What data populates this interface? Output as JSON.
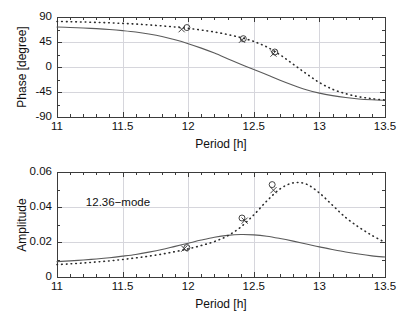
{
  "figure": {
    "background": "#ffffff",
    "axis_color": "#3b3b3b",
    "grid_color": "#d6d6dc",
    "solid_curve_color": "#5a5a5a",
    "dotted_curve_color": "#2b2b2b",
    "marker_color": "#303030"
  },
  "chart_data": [
    {
      "type": "line",
      "id": "phase-panel",
      "title": "",
      "xlabel": "Period [h]",
      "ylabel": "Phase [degree]",
      "xlim": [
        11,
        13.5
      ],
      "ylim": [
        -90,
        90
      ],
      "xticks": [
        11,
        11.5,
        12,
        12.5,
        13,
        13.5
      ],
      "xticklabels": [
        "11",
        "11.5",
        "12",
        "12.5",
        "13",
        "13.5"
      ],
      "yticks": [
        -90,
        -45,
        0,
        45,
        90
      ],
      "yticklabels": [
        "-90",
        "-45",
        "0",
        "45",
        "90"
      ],
      "x_minor_tick_step": 0.1,
      "grid": true,
      "legend": null,
      "series": [
        {
          "name": "model-solid",
          "style": "solid",
          "x": [
            11.0,
            11.1,
            11.2,
            11.3,
            11.4,
            11.5,
            11.6,
            11.7,
            11.8,
            11.9,
            12.0,
            12.1,
            12.2,
            12.3,
            12.4,
            12.5,
            12.6,
            12.7,
            12.8,
            12.9,
            13.0,
            13.1,
            13.2,
            13.3,
            13.4,
            13.5
          ],
          "values": [
            72.0,
            71.2,
            70.2,
            69.0,
            67.5,
            65.5,
            63.0,
            59.5,
            55.0,
            49.0,
            42.0,
            34.0,
            25.0,
            15.0,
            5.0,
            -4.5,
            -14.0,
            -24.0,
            -33.0,
            -41.0,
            -47.0,
            -51.5,
            -55.0,
            -57.5,
            -59.0,
            -60.0
          ]
        },
        {
          "name": "observed-fit-dotted",
          "style": "dotted",
          "x": [
            11.0,
            11.1,
            11.2,
            11.3,
            11.4,
            11.5,
            11.6,
            11.7,
            11.8,
            11.9,
            12.0,
            12.1,
            12.2,
            12.3,
            12.4,
            12.5,
            12.6,
            12.7,
            12.8,
            12.9,
            13.0,
            13.1,
            13.2,
            13.3,
            13.4,
            13.5
          ],
          "values": [
            82.0,
            81.5,
            81.0,
            80.3,
            79.5,
            78.5,
            77.3,
            75.8,
            74.0,
            72.0,
            69.5,
            66.5,
            63.0,
            58.5,
            53.0,
            46.0,
            36.0,
            22.0,
            5.0,
            -12.0,
            -28.0,
            -40.0,
            -48.0,
            -53.5,
            -57.0,
            -59.5
          ]
        }
      ],
      "markers": [
        {
          "shape": "circle",
          "x": 11.99,
          "y": 71.0
        },
        {
          "shape": "cross",
          "x": 11.95,
          "y": 68.0
        },
        {
          "shape": "circle",
          "x": 12.42,
          "y": 51.0
        },
        {
          "shape": "cross",
          "x": 12.41,
          "y": 49.0
        },
        {
          "shape": "circle",
          "x": 12.66,
          "y": 27.0
        },
        {
          "shape": "cross",
          "x": 12.65,
          "y": 24.0
        }
      ]
    },
    {
      "type": "line",
      "id": "amplitude-panel",
      "title": "",
      "xlabel": "Period [h]",
      "ylabel": "Amplitude",
      "annotation": "12.36−mode",
      "xlim": [
        11,
        13.5
      ],
      "ylim": [
        0,
        0.06
      ],
      "xticks": [
        11,
        11.5,
        12,
        12.5,
        13,
        13.5
      ],
      "xticklabels": [
        "11",
        "11.5",
        "12",
        "12.5",
        "13",
        "13.5"
      ],
      "yticks": [
        0,
        0.02,
        0.04,
        0.06
      ],
      "yticklabels": [
        "0",
        "0.02",
        "0.04",
        "0.06"
      ],
      "x_minor_tick_step": 0.1,
      "grid": true,
      "legend": null,
      "series": [
        {
          "name": "model-solid",
          "style": "solid",
          "x": [
            11.0,
            11.1,
            11.2,
            11.3,
            11.4,
            11.5,
            11.6,
            11.7,
            11.8,
            11.9,
            12.0,
            12.1,
            12.2,
            12.3,
            12.4,
            12.5,
            12.6,
            12.7,
            12.8,
            12.9,
            13.0,
            13.1,
            13.2,
            13.3,
            13.4,
            13.5
          ],
          "values": [
            0.0088,
            0.0092,
            0.0097,
            0.0103,
            0.011,
            0.0119,
            0.0129,
            0.0142,
            0.0157,
            0.0175,
            0.0193,
            0.0211,
            0.0227,
            0.0238,
            0.0243,
            0.0241,
            0.0233,
            0.022,
            0.0205,
            0.0189,
            0.0172,
            0.0157,
            0.0143,
            0.0131,
            0.0121,
            0.0114
          ]
        },
        {
          "name": "observed-fit-dotted",
          "style": "dotted",
          "x": [
            11.0,
            11.1,
            11.2,
            11.3,
            11.4,
            11.5,
            11.6,
            11.7,
            11.8,
            11.9,
            12.0,
            12.1,
            12.2,
            12.3,
            12.4,
            12.5,
            12.6,
            12.7,
            12.8,
            12.9,
            13.0,
            13.1,
            13.2,
            13.3,
            13.4,
            13.5
          ],
          "values": [
            0.0071,
            0.0075,
            0.008,
            0.0086,
            0.0092,
            0.01,
            0.0109,
            0.0119,
            0.0131,
            0.0145,
            0.0161,
            0.018,
            0.0203,
            0.0235,
            0.0285,
            0.0355,
            0.0435,
            0.0503,
            0.0538,
            0.0531,
            0.048,
            0.041,
            0.034,
            0.0285,
            0.0238,
            0.0198
          ]
        }
      ],
      "markers": [
        {
          "shape": "circle",
          "x": 11.99,
          "y": 0.0168
        },
        {
          "shape": "cross",
          "x": 11.97,
          "y": 0.0162
        },
        {
          "shape": "circle",
          "x": 12.41,
          "y": 0.0337
        },
        {
          "shape": "cross",
          "x": 12.43,
          "y": 0.0322
        },
        {
          "shape": "circle",
          "x": 12.64,
          "y": 0.0528
        },
        {
          "shape": "cross",
          "x": 12.65,
          "y": 0.0496
        }
      ]
    }
  ]
}
